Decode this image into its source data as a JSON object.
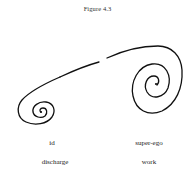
{
  "figure": {
    "title": "Figure 4.3",
    "labels": {
      "left_top": "id",
      "left_bottom": "discharge",
      "right_top": "super-ego",
      "right_bottom": "work"
    },
    "drawing": {
      "description": "Two hand-drawn spirals connected by a long curved line with a small gap near the middle",
      "stroke_color": "#111111",
      "left_spiral": {
        "label": "id",
        "center": [
          41,
          111
        ]
      },
      "right_spiral": {
        "label": "super-ego",
        "center": [
          154,
          82
        ]
      }
    }
  }
}
